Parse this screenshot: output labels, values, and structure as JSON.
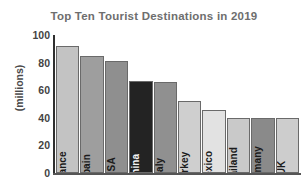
{
  "chart_data": {
    "type": "bar",
    "title": "Top Ten Tourist Destinations in 2019",
    "xlabel": "",
    "ylabel": "(millions)",
    "ylim": [
      0,
      100
    ],
    "yticks": [
      "0",
      "20",
      "40",
      "60",
      "80",
      "100"
    ],
    "grid": false,
    "legend": false,
    "categories": [
      "France",
      "Spain",
      "USA",
      "China",
      "Italy",
      "Turkey",
      "Mexico",
      "Thailand",
      "Germany",
      "UK"
    ],
    "values": [
      92,
      85,
      81,
      67,
      66,
      52,
      46,
      40,
      40,
      40
    ],
    "bar_colors": [
      "#c3c3c3",
      "#9e9e9e",
      "#8f8f8f",
      "#232323",
      "#909090",
      "#cfcfcf",
      "#e2e2e2",
      "#c9c9c9",
      "#8a8a8a",
      "#cdcdcd"
    ],
    "bar_label_colors": [
      "#1b1b1b",
      "#1b1b1b",
      "#1b1b1b",
      "#f2f2f2",
      "#1b1b1b",
      "#1b1b1b",
      "#1b1b1b",
      "#1b1b1b",
      "#1b1b1b",
      "#1b1b1b"
    ],
    "axis_color": "#2f2f2f",
    "title_color": "#6e6e6e"
  }
}
